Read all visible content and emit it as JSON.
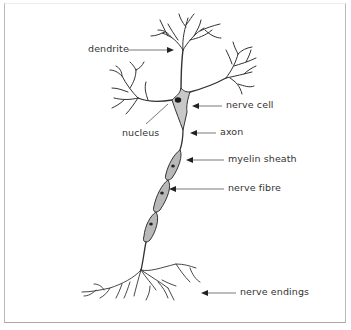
{
  "diagram": {
    "colors": {
      "ink": "#333333",
      "cell_fill": "#c8c8c8",
      "sheath_fill": "#b8b8b8",
      "frame": "#b8b8b8"
    },
    "labels": {
      "dendrite": "dendrite",
      "nerve_cell": "nerve cell",
      "nucleus": "nucleus",
      "axon": "axon",
      "myelin_sheath": "myelin sheath",
      "nerve_fibre": "nerve fibre",
      "nerve_endings": "nerve endings"
    }
  }
}
